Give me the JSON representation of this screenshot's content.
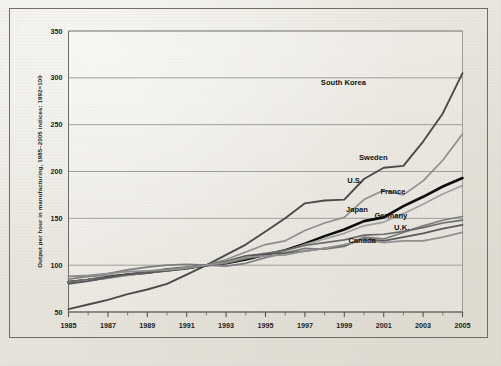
{
  "chart_data": {
    "type": "line",
    "title": "",
    "xlabel": "",
    "ylabel": "Output per hour in manufacturing, 1985–2005 indices: 1992=100",
    "xlim": [
      1985,
      2005
    ],
    "ylim": [
      50,
      350
    ],
    "grid": true,
    "legend_position": "inline-right",
    "y_ticks": [
      50,
      100,
      150,
      200,
      250,
      300,
      350
    ],
    "y_tick_labels": [
      "50",
      "100",
      "150",
      "200",
      "250",
      "300",
      "350"
    ],
    "x_ticks": [
      1985,
      1987,
      1989,
      1991,
      1993,
      1995,
      1997,
      1999,
      2001,
      2003,
      2005
    ],
    "x_tick_labels": [
      "1985",
      "1987",
      "1989",
      "1991",
      "1993",
      "1995",
      "1997",
      "1999",
      "2001",
      "2003",
      "2005"
    ],
    "x_minor_ticks": [
      1986,
      1988,
      1990,
      1992,
      1994,
      1996,
      1998,
      2000,
      2002,
      2004
    ],
    "x": [
      1985,
      1986,
      1987,
      1988,
      1989,
      1990,
      1991,
      1992,
      1993,
      1994,
      1995,
      1996,
      1997,
      1998,
      1999,
      2000,
      2001,
      2002,
      2003,
      2004,
      2005
    ],
    "series": [
      {
        "name": "South Korea",
        "color": "#4a4a4a",
        "width": 1.9,
        "label_x": 2000.1,
        "label_y": 292,
        "values": [
          53,
          58,
          63,
          69,
          74,
          80,
          90,
          100,
          111,
          122,
          136,
          150,
          166,
          169,
          170,
          192,
          204,
          206,
          232,
          262,
          305
        ]
      },
      {
        "name": "Sweden",
        "color": "#8e8e8e",
        "width": 1.7,
        "label_x": 2001.2,
        "label_y": 212,
        "values": [
          88,
          88,
          89,
          90,
          92,
          94,
          97,
          100,
          106,
          114,
          122,
          126,
          137,
          145,
          151,
          170,
          180,
          175,
          190,
          212,
          240
        ]
      },
      {
        "name": "U.S.",
        "color": "#0d0d0d",
        "width": 2.6,
        "label_x": 1999.9,
        "label_y": 188,
        "values": [
          82,
          84,
          87,
          90,
          92,
          95,
          97,
          100,
          102,
          106,
          111,
          116,
          123,
          131,
          138,
          147,
          151,
          163,
          173,
          184,
          193
        ]
      },
      {
        "name": "France",
        "color": "#a0a0a0",
        "width": 1.7,
        "label_x": 2002.1,
        "label_y": 176,
        "values": [
          82,
          84,
          86,
          89,
          92,
          94,
          97,
          100,
          103,
          109,
          113,
          115,
          122,
          128,
          134,
          142,
          146,
          155,
          165,
          176,
          185
        ]
      },
      {
        "name": "Japan",
        "color": "#7d7d7d",
        "width": 1.7,
        "label_x": 2000.2,
        "label_y": 157,
        "values": [
          85,
          88,
          91,
          95,
          98,
          100,
          101,
          100,
          99,
          102,
          108,
          113,
          118,
          117,
          120,
          130,
          128,
          135,
          142,
          148,
          152
        ]
      },
      {
        "name": "Germany",
        "color": "#6b6b6b",
        "width": 1.7,
        "label_x": 2002.2,
        "label_y": 150,
        "values": [
          82,
          85,
          87,
          90,
          93,
          96,
          98,
          100,
          102,
          107,
          112,
          116,
          121,
          124,
          127,
          132,
          133,
          136,
          140,
          145,
          148
        ]
      },
      {
        "name": "U.K.",
        "color": "#5a5a5a",
        "width": 1.7,
        "label_x": 2002.3,
        "label_y": 138,
        "values": [
          80,
          83,
          87,
          90,
          92,
          94,
          96,
          100,
          104,
          110,
          112,
          113,
          115,
          118,
          121,
          128,
          126,
          130,
          134,
          139,
          143
        ]
      },
      {
        "name": "Canada",
        "color": "#909090",
        "width": 1.8,
        "label_x": 2000.6,
        "label_y": 124,
        "values": [
          88,
          89,
          91,
          93,
          94,
          95,
          97,
          100,
          103,
          108,
          110,
          111,
          115,
          118,
          122,
          127,
          124,
          126,
          126,
          130,
          135
        ]
      }
    ]
  }
}
